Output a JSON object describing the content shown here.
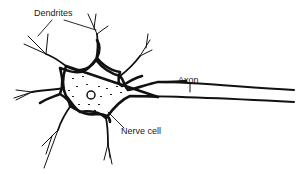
{
  "diagram": {
    "labels": {
      "dendrites": "Dendrites",
      "axon": "Axon",
      "nerve_cell": "Nerve cell"
    },
    "parts": [
      "dendrites",
      "cell body",
      "nucleus",
      "axon"
    ],
    "colors": {
      "stroke": "#111111",
      "background": "#ffffff"
    }
  }
}
